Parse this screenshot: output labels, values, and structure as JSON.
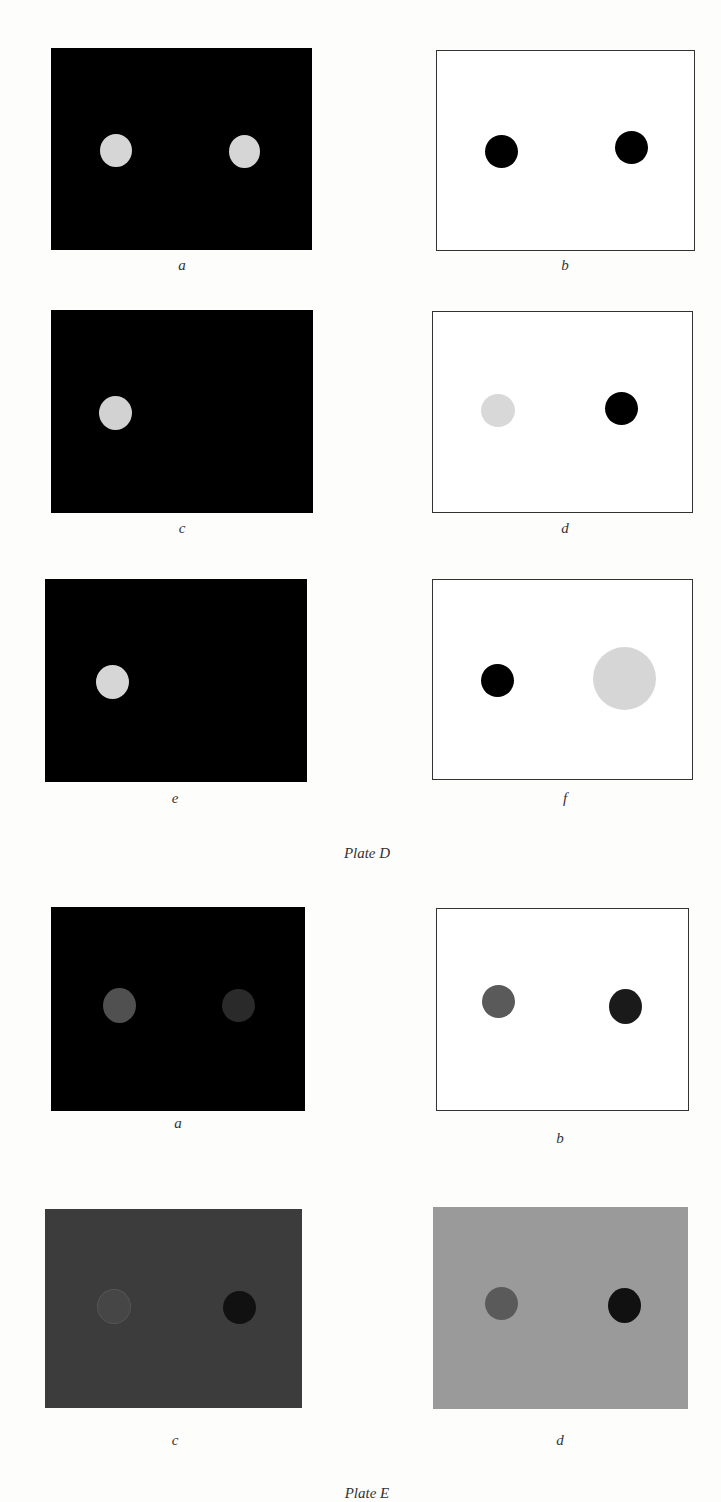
{
  "plates": [
    {
      "caption": "Plate D",
      "panels": [
        {
          "label": "a",
          "bg": "#000000",
          "border": "none",
          "dots": [
            {
              "fill": "#d6d6d6"
            },
            {
              "fill": "#d6d6d6"
            }
          ]
        },
        {
          "label": "b",
          "bg": "#ffffff",
          "border": "#333333",
          "dots": [
            {
              "fill": "#000000"
            },
            {
              "fill": "#000000"
            }
          ]
        },
        {
          "label": "c",
          "bg": "#000000",
          "border": "none",
          "dots": [
            {
              "fill": "#d2d2d2"
            }
          ]
        },
        {
          "label": "d",
          "bg": "#ffffff",
          "border": "#333333",
          "dots": [
            {
              "fill": "#d8d8d8"
            },
            {
              "fill": "#000000"
            }
          ]
        },
        {
          "label": "e",
          "bg": "#000000",
          "border": "none",
          "dots": [
            {
              "fill": "#d6d6d6"
            }
          ]
        },
        {
          "label": "f",
          "bg": "#ffffff",
          "border": "#333333",
          "dots": [
            {
              "fill": "#000000"
            },
            {
              "fill": "#d6d6d6",
              "large": true
            }
          ]
        }
      ]
    },
    {
      "caption": "Plate E",
      "panels": [
        {
          "label": "a",
          "bg": "#000000",
          "border": "none",
          "dots": [
            {
              "fill": "#505050"
            },
            {
              "fill": "#2a2a2a"
            }
          ]
        },
        {
          "label": "b",
          "bg": "#ffffff",
          "border": "#333333",
          "dots": [
            {
              "fill": "#5a5a5a"
            },
            {
              "fill": "#1a1a1a"
            }
          ]
        },
        {
          "label": "c",
          "bg": "#3c3c3c",
          "border": "none",
          "dots": [
            {
              "fill": "#464646"
            },
            {
              "fill": "#111111"
            }
          ]
        },
        {
          "label": "d",
          "bg": "#9a9a9a",
          "border": "none",
          "dots": [
            {
              "fill": "#5a5a5a"
            },
            {
              "fill": "#111111"
            }
          ]
        }
      ]
    }
  ]
}
